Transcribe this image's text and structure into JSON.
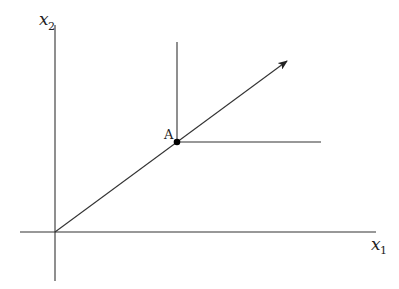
{
  "diagram": {
    "axes": {
      "x_label": "x",
      "x_subscript": "1",
      "y_label": "x",
      "y_subscript": "2"
    },
    "point": {
      "label": "A"
    },
    "elements": [
      "horizontal axis x1",
      "vertical axis x2",
      "ray from origin through point A with arrowhead",
      "vertical line segment above A",
      "horizontal line segment right of A"
    ],
    "colors": {
      "line": "#333333",
      "point": "#000000",
      "background": "#ffffff"
    }
  }
}
